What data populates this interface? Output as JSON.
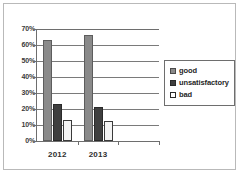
{
  "chart_data": {
    "type": "bar",
    "title": "",
    "subtitle": "",
    "xlabel": "",
    "ylabel": "",
    "categories": [
      "2012",
      "2013"
    ],
    "series": [
      {
        "name": "good",
        "color": "#8a8a8a",
        "values": [
          63,
          66
        ]
      },
      {
        "name": "unsatisfactory",
        "color": "#3f3f3f",
        "values": [
          23,
          21
        ]
      },
      {
        "name": "bad",
        "color": "#ffffff",
        "values": [
          13,
          12.5
        ]
      }
    ],
    "ylim": [
      0,
      70
    ],
    "y_tick_step": 10,
    "y_tick_labels": [
      "70%",
      "60%",
      "50%",
      "40%",
      "30%",
      "20%",
      "10%",
      "0%"
    ],
    "y_tick_values": [
      70,
      60,
      50,
      40,
      30,
      20,
      10,
      0
    ],
    "value_suffix": "%",
    "grid": true,
    "grid_axis": "y",
    "legend_position": "right",
    "legend_entries": [
      "good",
      "unsatisfactory",
      "bad"
    ],
    "annotations": [],
    "frame": true
  },
  "legend": {
    "items": [
      {
        "label": "good"
      },
      {
        "label": "unsatisfactory"
      },
      {
        "label": "bad"
      }
    ]
  },
  "axes": {
    "x_tick_labels": [
      "2012",
      "2013"
    ],
    "y_tick_labels": [
      "70%",
      "60%",
      "50%",
      "40%",
      "30%",
      "20%",
      "10%",
      "0%"
    ]
  },
  "colors": {
    "good": "#8a8a8a",
    "unsatisfactory": "#3f3f3f",
    "bad": "#ffffff",
    "axis": "#6e6e6e",
    "grid": "#7a7a7a",
    "frame": "#b9b9b9",
    "text": "#2e2e2e"
  }
}
